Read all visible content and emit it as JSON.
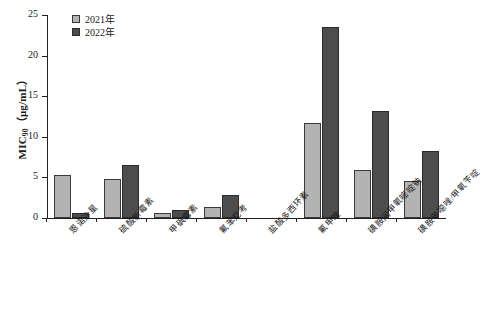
{
  "chart_data": {
    "type": "bar",
    "title": "",
    "xlabel": "",
    "ylabel": "MIC90 (μg/mL)",
    "ylabel_main": "MIC",
    "ylabel_sub": "90",
    "ylabel_unit": "（μg/mL）",
    "ylim": [
      0,
      25
    ],
    "ytick_labels": [
      "0",
      "5",
      "10",
      "15",
      "20",
      "25"
    ],
    "ytick_values": [
      0,
      5,
      10,
      15,
      20,
      25
    ],
    "grid": false,
    "legend_position": "top-left",
    "categories": [
      "恩诺沙星",
      "硫酸新霉素",
      "甲砜霉素",
      "氟苯尼考",
      "盐酸多西环素",
      "氟甲喹",
      "磺胺间甲氧嘧啶钠",
      "磺胺甲噁唑/甲氧苄啶"
    ],
    "series": [
      {
        "name": "2021年",
        "color": "#b3b3b3",
        "values": [
          5.3,
          4.8,
          0.6,
          1.4,
          0,
          11.7,
          5.9,
          4.5
        ]
      },
      {
        "name": "2022年",
        "color": "#4d4d4d",
        "values": [
          0.6,
          6.5,
          1.0,
          2.8,
          0,
          23.5,
          13.2,
          8.3
        ]
      }
    ]
  }
}
